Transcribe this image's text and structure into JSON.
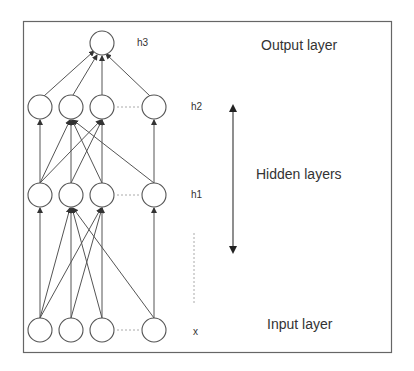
{
  "diagram": {
    "layer_labels": {
      "output": "Output layer",
      "hidden": "Hidden layers",
      "input": "Input layer"
    },
    "row_labels": {
      "h3": "h3",
      "h2": "h2",
      "h1": "h1",
      "x": "x"
    },
    "colors": {
      "stroke": "#555555",
      "dotted": "#aaaaaa",
      "border": "#666666"
    }
  }
}
